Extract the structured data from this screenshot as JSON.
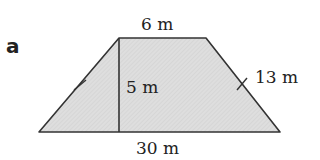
{
  "part_label": "a",
  "shape": "trapezium",
  "labels": {
    "top": "6 m",
    "height": "5 m",
    "slant": "13 m",
    "bottom": "30 m"
  },
  "colors": {
    "fill": "#dcdcdc",
    "stroke": "#333333"
  }
}
